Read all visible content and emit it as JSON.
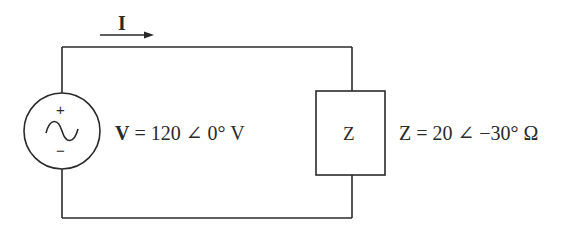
{
  "diagram": {
    "type": "ac-circuit",
    "current": {
      "symbol": "I",
      "direction": "right"
    },
    "source": {
      "kind": "ac-voltage-source",
      "plus_sign": "+",
      "minus_sign": "−",
      "symbol": "V",
      "label_rest": " = 120 ∠ 0° V",
      "magnitude": 120,
      "angle_deg": 0,
      "unit": "V"
    },
    "load": {
      "kind": "impedance",
      "box_label": "Z",
      "symbol": "Z",
      "label_rest": " = 20 ∠ −30° Ω",
      "magnitude": 20,
      "angle_deg": -30,
      "unit": "Ω"
    },
    "colors": {
      "line": "#2a2a2a",
      "background": "#ffffff"
    }
  }
}
